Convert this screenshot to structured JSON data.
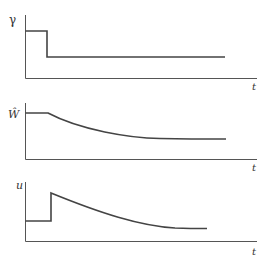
{
  "panels": [
    {
      "name": "gamma-panel",
      "ylabel": "γ",
      "xlabel": "t",
      "description": "step down: high level then drops to constant low level"
    },
    {
      "name": "w-hat-panel",
      "ylabel": "Ŵ",
      "xlabel": "t",
      "description": "constant then smoothly decays toward lower steady level"
    },
    {
      "name": "u-panel",
      "ylabel": "u",
      "xlabel": "t",
      "description": "constant low, jumps up at step time, then decays"
    }
  ],
  "colors": {
    "axis": "#555555",
    "curve": "#444444"
  }
}
